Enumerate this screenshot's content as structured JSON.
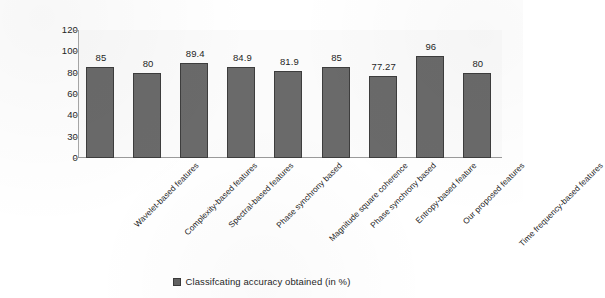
{
  "chart_data": {
    "type": "bar",
    "title": "",
    "subtitle": "",
    "xlabel": "",
    "ylabel": "",
    "orientation": "vertical",
    "grid": false,
    "legend_position": "bottom-center",
    "ylim": [
      0,
      120
    ],
    "ytick_labels": [
      "120",
      "100",
      "80",
      "60",
      "40",
      "30",
      "0"
    ],
    "ytick_values": [
      120,
      100,
      80,
      60,
      40,
      30,
      0
    ],
    "categories": [
      "Wavelet-based features",
      "Complexity-based features",
      "Spectral-based features",
      "Phase synchrony based",
      "Magnitude square coherence",
      "Phase synchrony based",
      "Entropy-based feature",
      "Our proposed features",
      "Time frequency-based features"
    ],
    "values": [
      85,
      80,
      89.4,
      84.9,
      81.9,
      85,
      77.27,
      96,
      80
    ],
    "value_labels": [
      "85",
      "80",
      "89.4",
      "84.9",
      "81.9",
      "85",
      "77.27",
      "96",
      "80"
    ],
    "series": [
      {
        "name": "Classifcating accuracy obtained (in %)",
        "color": "#6a6a6a",
        "values": [
          85,
          80,
          89.4,
          84.9,
          81.9,
          85,
          77.27,
          96,
          80
        ]
      }
    ],
    "legend": [
      {
        "label": "Classifcating accuracy obtained (in %)",
        "color": "#6a6a6a"
      }
    ]
  },
  "colors": {
    "bar_fill": "#6a6a6a",
    "bar_stroke": "#3d3d3d",
    "axis": "#9a9a9a",
    "text": "#1f1f1f",
    "plot_background": "#fbfbfb",
    "page_background": "#ffffff"
  }
}
